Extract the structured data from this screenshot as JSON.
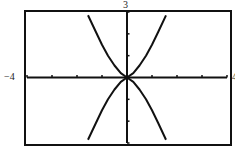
{
  "chart_data": {
    "type": "line",
    "title": "",
    "xlabel": "",
    "ylabel": "",
    "xlim": [
      -4,
      4
    ],
    "ylim": [
      -3,
      3
    ],
    "window_labels": {
      "xmin": "−4",
      "xmax": "4",
      "ymax": "3"
    },
    "x_ticks": [
      -4,
      -3,
      -2,
      -1,
      0,
      1,
      2,
      3,
      4
    ],
    "y_ticks": [
      -3,
      -2,
      -1,
      0,
      1,
      2,
      3
    ],
    "grid": false,
    "legend": null,
    "series": [
      {
        "name": "upper-right",
        "x": [
          0,
          0.25,
          0.5,
          0.76,
          1.0,
          1.25,
          1.56
        ],
        "y": [
          0,
          0.2,
          0.55,
          1.0,
          1.5,
          2.1,
          2.85
        ]
      },
      {
        "name": "upper-left",
        "x": [
          0,
          -0.25,
          -0.5,
          -0.76,
          -1.0,
          -1.25,
          -1.56
        ],
        "y": [
          0,
          0.2,
          0.55,
          1.0,
          1.5,
          2.1,
          2.85
        ]
      },
      {
        "name": "lower-right",
        "x": [
          0,
          0.25,
          0.5,
          0.76,
          1.0,
          1.25,
          1.56
        ],
        "y": [
          0,
          -0.2,
          -0.55,
          -1.0,
          -1.5,
          -2.1,
          -2.85
        ]
      },
      {
        "name": "lower-left",
        "x": [
          0,
          -0.25,
          -0.5,
          -0.76,
          -1.0,
          -1.25,
          -1.56
        ],
        "y": [
          0,
          -0.2,
          -0.55,
          -1.0,
          -1.5,
          -2.1,
          -2.85
        ]
      }
    ]
  },
  "colors": {
    "ink": "#111111",
    "background": "#ffffff"
  }
}
